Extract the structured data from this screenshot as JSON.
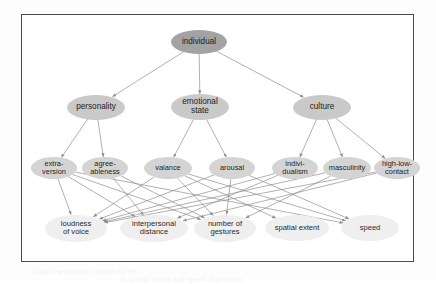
{
  "figure": {
    "frame": {
      "border_color": "#4a4a4a",
      "background": "#ffffff"
    }
  },
  "colors": {
    "node_level1_fill": "#a3a3a3",
    "node_level2_fill": "#c9c9c9",
    "node_level3_fill": "#d4d4d4",
    "node_level4_fill": "#efefef",
    "edge_color": "#8f8f8f",
    "text_color": "#1d1d1d",
    "frame_border": "#4a4a4a"
  },
  "chart_data": {
    "type": "diagram",
    "title": "",
    "layout": "top-down directed acyclic graph, 4 levels",
    "nodes": [
      {
        "id": "individual",
        "label": "individual",
        "level": 1,
        "x": 199,
        "y": 42,
        "w": 56,
        "h": 24
      },
      {
        "id": "personality",
        "label": "personality",
        "level": 2,
        "x": 96,
        "y": 107,
        "w": 58,
        "h": 25
      },
      {
        "id": "emotional_state",
        "label": "emotional\nstate",
        "level": 2,
        "x": 200,
        "y": 107,
        "w": 58,
        "h": 26
      },
      {
        "id": "culture",
        "label": "culture",
        "level": 2,
        "x": 322,
        "y": 107,
        "w": 58,
        "h": 25
      },
      {
        "id": "extraversion",
        "label": "extra-\nversion",
        "level": 3,
        "x": 54,
        "y": 168,
        "w": 46,
        "h": 22
      },
      {
        "id": "agreeableness",
        "label": "agree-\nableness",
        "level": 3,
        "x": 105,
        "y": 168,
        "w": 46,
        "h": 22
      },
      {
        "id": "valance",
        "label": "valance",
        "level": 3,
        "x": 168,
        "y": 168,
        "w": 48,
        "h": 22
      },
      {
        "id": "arousal",
        "label": "arousal",
        "level": 3,
        "x": 232,
        "y": 168,
        "w": 46,
        "h": 22
      },
      {
        "id": "individualism",
        "label": "indivi-\ndualism",
        "level": 3,
        "x": 295,
        "y": 168,
        "w": 46,
        "h": 22
      },
      {
        "id": "masculinity",
        "label": "masculinity",
        "level": 3,
        "x": 347,
        "y": 168,
        "w": 48,
        "h": 22
      },
      {
        "id": "high_low_contact",
        "label": "high-low-\ncontact",
        "level": 3,
        "x": 397,
        "y": 168,
        "w": 46,
        "h": 22
      },
      {
        "id": "loudness_of_voice",
        "label": "loudness\nof voice",
        "level": 4,
        "x": 76,
        "y": 228,
        "w": 62,
        "h": 27
      },
      {
        "id": "interpersonal_distance",
        "label": "interpersonal\ndistance",
        "level": 4,
        "x": 154,
        "y": 228,
        "w": 68,
        "h": 27
      },
      {
        "id": "number_of_gestures",
        "label": "number of\ngestures",
        "level": 4,
        "x": 225,
        "y": 228,
        "w": 62,
        "h": 27
      },
      {
        "id": "spatial_extent",
        "label": "spatial extent",
        "level": 4,
        "x": 297,
        "y": 228,
        "w": 64,
        "h": 26
      },
      {
        "id": "speed",
        "label": "speed",
        "level": 4,
        "x": 370,
        "y": 228,
        "w": 58,
        "h": 26
      }
    ],
    "edges": [
      {
        "from": "individual",
        "to": "personality"
      },
      {
        "from": "individual",
        "to": "emotional_state"
      },
      {
        "from": "individual",
        "to": "culture"
      },
      {
        "from": "personality",
        "to": "extraversion"
      },
      {
        "from": "personality",
        "to": "agreeableness"
      },
      {
        "from": "emotional_state",
        "to": "valance"
      },
      {
        "from": "emotional_state",
        "to": "arousal"
      },
      {
        "from": "culture",
        "to": "individualism"
      },
      {
        "from": "culture",
        "to": "masculinity"
      },
      {
        "from": "culture",
        "to": "high_low_contact"
      },
      {
        "from": "extraversion",
        "to": "loudness_of_voice"
      },
      {
        "from": "extraversion",
        "to": "interpersonal_distance"
      },
      {
        "from": "extraversion",
        "to": "number_of_gestures"
      },
      {
        "from": "extraversion",
        "to": "speed"
      },
      {
        "from": "agreeableness",
        "to": "interpersonal_distance"
      },
      {
        "from": "agreeableness",
        "to": "number_of_gestures"
      },
      {
        "from": "valance",
        "to": "loudness_of_voice"
      },
      {
        "from": "valance",
        "to": "number_of_gestures"
      },
      {
        "from": "valance",
        "to": "spatial_extent"
      },
      {
        "from": "valance",
        "to": "speed"
      },
      {
        "from": "arousal",
        "to": "loudness_of_voice"
      },
      {
        "from": "arousal",
        "to": "number_of_gestures"
      },
      {
        "from": "arousal",
        "to": "speed"
      },
      {
        "from": "individualism",
        "to": "interpersonal_distance"
      },
      {
        "from": "individualism",
        "to": "loudness_of_voice"
      },
      {
        "from": "masculinity",
        "to": "loudness_of_voice"
      },
      {
        "from": "masculinity",
        "to": "number_of_gestures"
      },
      {
        "from": "high_low_contact",
        "to": "interpersonal_distance"
      },
      {
        "from": "high_low_contact",
        "to": "loudness_of_voice"
      }
    ]
  },
  "background_ghost_text": [
    {
      "text": "tion of the  behaviour  expression  module  and",
      "x": 26,
      "y": 22
    },
    {
      "text": "in  which  the  mapping  between  the",
      "x": 24,
      "y": 33
    },
    {
      "text": "and  the  expressive  parameters  is",
      "x": 30,
      "y": 44
    },
    {
      "text": "the  relations  described",
      "x": 36,
      "y": 56
    },
    {
      "text": "of  the  individual  characteristics",
      "x": 28,
      "y": 112
    },
    {
      "text": "the  agent  are  used  to  compute",
      "x": 32,
      "y": 124
    },
    {
      "text": "expressivity  of  the  behaviours",
      "x": 30,
      "y": 136
    },
    {
      "text": "personality  traits  and  emotional",
      "x": 26,
      "y": 148
    },
    {
      "text": "high-low-contact  cultures  differ",
      "x": 34,
      "y": 268
    },
    {
      "text": "in  spatial  extent  and  speed  of  gestures",
      "x": 120,
      "y": 276
    }
  ]
}
